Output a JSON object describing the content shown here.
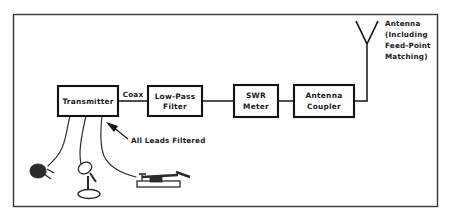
{
  "figure": {
    "border_color": "#3a3a3a",
    "line_color": "#131313",
    "background": "#fefefe"
  },
  "blocks": [
    {
      "id": "transmitter",
      "label_lines": [
        "Transmitter"
      ],
      "x": 58,
      "y": 86,
      "w": 60,
      "h": 30
    },
    {
      "id": "low-pass-filter",
      "label_lines": [
        "Low-Pass",
        "Filter"
      ],
      "x": 148,
      "y": 86,
      "w": 54,
      "h": 30
    },
    {
      "id": "swr-meter",
      "label_lines": [
        "SWR",
        "Meter"
      ],
      "x": 234,
      "y": 85,
      "w": 44,
      "h": 32
    },
    {
      "id": "antenna-coupler",
      "label_lines": [
        "Antenna",
        "Coupler"
      ],
      "x": 294,
      "y": 85,
      "w": 60,
      "h": 32
    }
  ],
  "labels": {
    "coax": "Coax",
    "all_leads_filtered": "All Leads Filtered",
    "antenna_lines": [
      "Antenna",
      "(Including",
      "Feed-Point",
      "Matching)"
    ]
  },
  "peripherals": [
    {
      "id": "power-plug",
      "name": "power-plug-icon"
    },
    {
      "id": "microphone",
      "name": "microphone-icon"
    },
    {
      "id": "telegraph-key",
      "name": "telegraph-key-icon"
    }
  ],
  "antenna": {
    "name": "dipole-antenna-icon",
    "feedline_x": 367,
    "apex_y": 30
  }
}
